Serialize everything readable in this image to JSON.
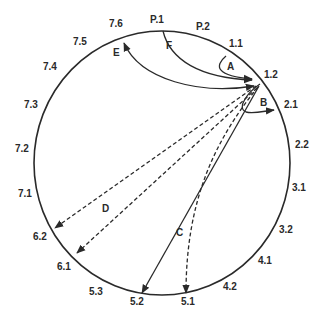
{
  "diagram": {
    "title_cropped": "",
    "colors": {
      "stroke": "#2a2a2a",
      "background": "#ffffff",
      "text": "#2a2a2a"
    },
    "circle": {
      "cx": 162,
      "cy": 163,
      "rx": 128,
      "ry": 132
    },
    "hub_point": {
      "x": 260,
      "y": 84,
      "label": "1.2"
    },
    "position_labels": [
      {
        "id": "P.1",
        "text": "P.1",
        "x": 150,
        "y": 23
      },
      {
        "id": "P.2",
        "text": "P.2",
        "x": 196,
        "y": 30
      },
      {
        "id": "1.1",
        "text": "1.1",
        "x": 229,
        "y": 47
      },
      {
        "id": "1.2",
        "text": "1.2",
        "x": 264,
        "y": 78
      },
      {
        "id": "2.1",
        "text": "2.1",
        "x": 284,
        "y": 108
      },
      {
        "id": "2.2",
        "text": "2.2",
        "x": 295,
        "y": 148
      },
      {
        "id": "3.1",
        "text": "3.1",
        "x": 292,
        "y": 191
      },
      {
        "id": "3.2",
        "text": "3.2",
        "x": 279,
        "y": 233
      },
      {
        "id": "4.1",
        "text": "4.1",
        "x": 258,
        "y": 264
      },
      {
        "id": "4.2",
        "text": "4.2",
        "x": 223,
        "y": 290
      },
      {
        "id": "5.1",
        "text": "5.1",
        "x": 181,
        "y": 305
      },
      {
        "id": "5.2",
        "text": "5.2",
        "x": 130,
        "y": 305
      },
      {
        "id": "5.3",
        "text": "5.3",
        "x": 89,
        "y": 295
      },
      {
        "id": "6.1",
        "text": "6.1",
        "x": 57,
        "y": 270
      },
      {
        "id": "6.2",
        "text": "6.2",
        "x": 33,
        "y": 240
      },
      {
        "id": "7.1",
        "text": "7.1",
        "x": 18,
        "y": 197
      },
      {
        "id": "7.2",
        "text": "7.2",
        "x": 15,
        "y": 152
      },
      {
        "id": "7.3",
        "text": "7.3",
        "x": 24,
        "y": 108
      },
      {
        "id": "7.4",
        "text": "7.4",
        "x": 43,
        "y": 70
      },
      {
        "id": "7.5",
        "text": "7.5",
        "x": 73,
        "y": 45
      },
      {
        "id": "7.6",
        "text": "7.6",
        "x": 109,
        "y": 27
      }
    ],
    "arrows": [
      {
        "id": "A",
        "label": "A",
        "label_x": 227,
        "label_y": 70,
        "style": "solid",
        "from": "1.1",
        "to": "1.2",
        "path": "M 226 56 C 214 66, 216 76, 252 79",
        "head_end": true,
        "head_start": false
      },
      {
        "id": "B",
        "label": "B",
        "label_x": 260,
        "label_y": 106,
        "style": "solid",
        "from": "1.2",
        "to": "2.1",
        "path": "M 260 84 C 248 92, 236 108, 246 112 C 254 114, 264 111, 274 110",
        "head_end": true,
        "head_start": false
      },
      {
        "id": "C",
        "label": "C",
        "label_x": 176,
        "label_y": 236,
        "style": "solid",
        "from": "1.2",
        "to": "5.2",
        "path": "M 259 86 L 142 293",
        "head_end": true,
        "head_start": false
      },
      {
        "id": "C-dashed",
        "label": "",
        "label_x": 0,
        "label_y": 0,
        "style": "dashed",
        "from": "1.2",
        "to": "5.1",
        "path": "M 258 87 C 215 140, 186 200, 186 293",
        "head_end": true,
        "head_start": false
      },
      {
        "id": "D1",
        "label": "D",
        "label_x": 102,
        "label_y": 212,
        "style": "dashed",
        "from": "1.2",
        "to": "6.2",
        "path": "M 256 86 L 55 228",
        "head_end": true,
        "head_start": false
      },
      {
        "id": "D2",
        "label": "",
        "label_x": 0,
        "label_y": 0,
        "style": "dashed",
        "from": "1.2",
        "to": "6.1",
        "path": "M 257 88 L 77 253",
        "head_end": true,
        "head_start": false
      },
      {
        "id": "E",
        "label": "E",
        "label_x": 113,
        "label_y": 56,
        "style": "solid",
        "from": "7.6",
        "to": "1.2",
        "path": "M 124 43 C 140 80, 200 95, 254 86",
        "head_end": true,
        "head_start": true
      },
      {
        "id": "F",
        "label": "F",
        "label_x": 166,
        "label_y": 49,
        "style": "solid",
        "from": "P.1",
        "to": "1.2",
        "path": "M 163 31 C 170 60, 200 78, 252 80",
        "head_end": true,
        "head_start": false
      }
    ]
  }
}
